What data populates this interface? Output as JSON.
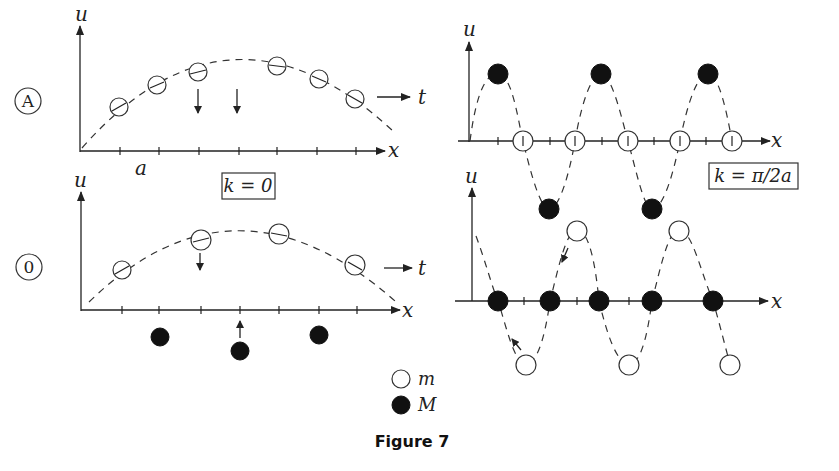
{
  "figure": {
    "caption": "Figure 7",
    "panels": {
      "top_left": {
        "marker": "A",
        "y_label": "u",
        "x_label": "x",
        "t_label": "t",
        "lattice_label": "a",
        "k_label": "k = 0"
      },
      "bottom_left": {
        "marker": "0",
        "y_label": "u",
        "x_label": "x",
        "t_label": "t"
      },
      "top_right": {
        "y_label": "u",
        "x_label": "x",
        "k_label": "k = π/2a"
      },
      "bottom_right": {
        "y_label": "u",
        "x_label": "x"
      }
    },
    "legend": [
      {
        "symbol": "open-circle",
        "label": "m"
      },
      {
        "symbol": "filled-circle",
        "label": "M"
      }
    ]
  }
}
